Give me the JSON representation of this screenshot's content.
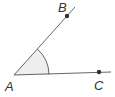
{
  "diagram": {
    "type": "angle",
    "points": {
      "A": {
        "label": "A",
        "x": 14,
        "y": 75
      },
      "B": {
        "label": "B",
        "x": 67,
        "y": 16
      },
      "C": {
        "label": "C",
        "x": 99,
        "y": 72
      }
    },
    "rays": [
      {
        "from": "A",
        "through": "B",
        "end": [
          75,
          7
        ]
      },
      {
        "from": "A",
        "through": "C",
        "end": [
          111,
          72
        ]
      }
    ],
    "angle_mark": {
      "vertex": "A",
      "between": [
        "B",
        "C"
      ],
      "radius": 35,
      "fill": "#eeeeee"
    },
    "colors": {
      "line": "#555555",
      "point": "#333333"
    }
  }
}
